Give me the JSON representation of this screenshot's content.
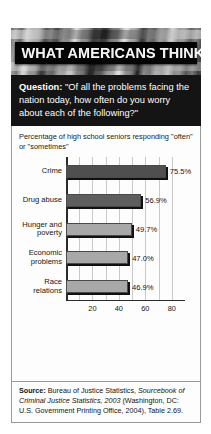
{
  "figure": {
    "title": "WHAT AMERICANS THINK",
    "question_label": "Question:",
    "question_text": "\"Of all the problems facing the nation today, how often do you worry about each of the following?\""
  },
  "chart_data": {
    "type": "bar",
    "orientation": "horizontal",
    "title": "Percentage of high school seniors responding \"often\" or \"sometimes\"",
    "categories": [
      "Crime",
      "Drug abuse",
      "Hunger and poverty",
      "Economic problems",
      "Race relations"
    ],
    "values": [
      75.5,
      56.9,
      49.7,
      47.0,
      46.9
    ],
    "value_labels": [
      "75.5%",
      "56.9%",
      "49.7%",
      "47.0%",
      "46.9%"
    ],
    "bar_colors": [
      "#4f4f4f",
      "#5e5e5e",
      "#a8a8a8",
      "#a8a8a8",
      "#a8a8a8"
    ],
    "xlabel": "",
    "ylabel": "",
    "xlim": [
      0,
      90
    ],
    "xticks": [
      20,
      40,
      60,
      80
    ],
    "xtick_labels": [
      "20",
      "40",
      "60",
      "80"
    ],
    "gridlines": [
      10,
      20,
      30,
      40,
      50,
      60,
      70,
      80
    ],
    "grid": true,
    "legend": false
  },
  "source": {
    "label": "Source:",
    "part1": " Bureau of Justice Statistics, ",
    "italic": "Sourcebook of Criminal Justice Statistics, 2003",
    "part2": " (Washington, DC: U.S. Government Printing Office, 2004), Table 2.69."
  }
}
